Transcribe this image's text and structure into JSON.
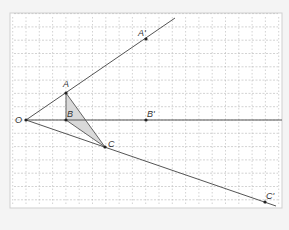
{
  "diagram": {
    "type": "geometric-homothety",
    "frame": {
      "x": 10,
      "y": 13,
      "width": 272,
      "height": 195,
      "fill": "#ffffff",
      "stroke": "#cfcfcf"
    },
    "grid": {
      "origin_x": 26,
      "origin_y": 120,
      "spacing": 13.3,
      "color": "#b5b5b5"
    },
    "points": [
      {
        "id": "O",
        "label": "O",
        "x": 26,
        "y": 120,
        "lx": 15,
        "ly": 123
      },
      {
        "id": "A",
        "label": "A",
        "x": 66,
        "y": 93,
        "lx": 63,
        "ly": 87
      },
      {
        "id": "B",
        "label": "B",
        "x": 66,
        "y": 120,
        "lx": 67,
        "ly": 117
      },
      {
        "id": "C",
        "label": "C",
        "x": 105,
        "y": 147,
        "lx": 108,
        "ly": 147
      },
      {
        "id": "A2",
        "label": "A'",
        "x": 146,
        "y": 39,
        "lx": 138,
        "ly": 36
      },
      {
        "id": "B2",
        "label": "B'",
        "x": 146,
        "y": 120,
        "lx": 147,
        "ly": 117
      },
      {
        "id": "C2",
        "label": "C'",
        "x": 265,
        "y": 202,
        "lx": 266,
        "ly": 199
      }
    ],
    "lines": [
      {
        "name": "ray-OA",
        "x1": 26,
        "y1": 120,
        "x2": 175,
        "y2": 18
      },
      {
        "name": "ray-OB",
        "x1": 26,
        "y1": 120,
        "x2": 282,
        "y2": 120
      },
      {
        "name": "ray-OC",
        "x1": 26,
        "y1": 120,
        "x2": 276,
        "y2": 206
      }
    ],
    "triangle": {
      "name": "triangle-ABC",
      "vertices": [
        "A",
        "B",
        "C"
      ],
      "fill": "#d9d9d9",
      "stroke": "#555555"
    },
    "line_color": "#555555",
    "point_color": "#222222"
  }
}
